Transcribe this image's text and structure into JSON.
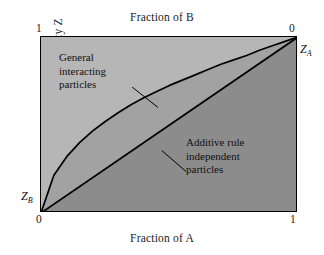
{
  "chart_data": {
    "type": "line",
    "title": "",
    "subtitle": "",
    "xlabel": "Fraction of A",
    "ylabel": "Property Z",
    "top_axis_label": "Fraction of B",
    "xlim": [
      0,
      1
    ],
    "ylim": [
      0,
      1
    ],
    "grid": false,
    "legend_position": "none",
    "x_ticks_bottom": [
      "0",
      "1"
    ],
    "x_ticks_top": [
      "1",
      "0"
    ],
    "endpoint_labels": [
      {
        "name": "Z_B",
        "symbol": "Z",
        "subscript": "B",
        "x": 0,
        "y": 0
      },
      {
        "name": "Z_A",
        "symbol": "Z",
        "subscript": "A",
        "x": 1,
        "y": 1
      }
    ],
    "series": [
      {
        "name": "General interacting particles",
        "style": "curve",
        "x": [
          0.0,
          0.05,
          0.1,
          0.15,
          0.2,
          0.25,
          0.3,
          0.35,
          0.4,
          0.45,
          0.5,
          0.55,
          0.6,
          0.65,
          0.7,
          0.75,
          0.8,
          0.85,
          0.9,
          0.95,
          1.0
        ],
        "values": [
          0.0,
          0.215,
          0.32,
          0.4,
          0.465,
          0.52,
          0.57,
          0.615,
          0.655,
          0.69,
          0.725,
          0.755,
          0.785,
          0.815,
          0.845,
          0.87,
          0.895,
          0.925,
          0.95,
          0.975,
          1.0
        ]
      },
      {
        "name": "Additive rule independent particles",
        "style": "straight",
        "x": [
          0.0,
          1.0
        ],
        "values": [
          0.0,
          1.0
        ]
      }
    ],
    "annotations": [
      {
        "name": "general-interacting-particles",
        "lines": [
          "General",
          "interacting",
          "particles"
        ],
        "leader_from": [
          0.355,
          0.715
        ],
        "leader_to": [
          0.455,
          0.6
        ]
      },
      {
        "name": "additive-rule-independent-particles",
        "lines": [
          "Additive rule",
          "independent",
          "particles"
        ],
        "leader_from": [
          0.565,
          0.235
        ],
        "leader_to": [
          0.47,
          0.355
        ]
      }
    ],
    "regions": [
      {
        "name": "above-curve",
        "color": "#b6b6b6"
      },
      {
        "name": "between-curve-and-line",
        "color": "#a2a2a2"
      },
      {
        "name": "below-line",
        "color": "#8c8c8c"
      }
    ],
    "colors": {
      "page_background": "#ffffff",
      "frame": "#000000",
      "curve": "#000000",
      "text": "#111111"
    }
  }
}
